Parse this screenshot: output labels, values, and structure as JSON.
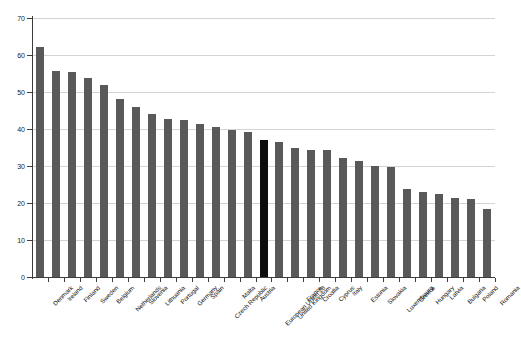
{
  "chart_data": {
    "type": "bar",
    "title": "",
    "subtitle": "",
    "xlabel": "",
    "ylabel": "",
    "ylim": [
      0,
      70
    ],
    "ytick_step": 10,
    "ytick_labels": [
      "0",
      "10",
      "20",
      "30",
      "40",
      "50",
      "60",
      "70"
    ],
    "grid": true,
    "legend": "none",
    "orientation": "vertical",
    "sorted": "descending",
    "bar_color": "#595959",
    "highlight_color": "#0d0d0d",
    "highlight_category": "European Union 28",
    "categories": [
      "Denmark",
      "Ireland",
      "Finland",
      "Sweden",
      "Belgium",
      "Netherlands",
      "Slovenia",
      "Lithuania",
      "Portugal",
      "Germany",
      "Spain",
      "Czech Republic",
      "Malta",
      "Austria",
      "European Union 28",
      "United Kingdom",
      "France",
      "Croatia",
      "Cyprus",
      "Italy",
      "Estonia",
      "Slovakia",
      "Luxembourg",
      "Greece",
      "Hungary",
      "Latvia",
      "Bulgaria",
      "Poland",
      "Romania"
    ],
    "values": [
      62.3,
      55.7,
      55.5,
      53.7,
      51.8,
      48.0,
      46.0,
      44.0,
      42.6,
      42.4,
      41.4,
      40.5,
      39.7,
      39.1,
      37.1,
      36.6,
      35.0,
      34.4,
      34.2,
      32.2,
      31.3,
      30.0,
      29.6,
      23.8,
      22.9,
      22.4,
      21.3,
      21.0,
      18.3
    ]
  }
}
